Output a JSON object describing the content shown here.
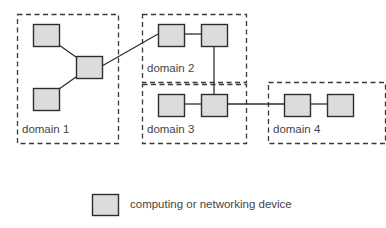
{
  "diagram": {
    "domains": [
      {
        "id": "d1",
        "label": "domain 1",
        "x": 17,
        "y": 14,
        "w": 101,
        "h": 129,
        "label_x": 22,
        "label_y": 124
      },
      {
        "id": "d2",
        "label": "domain 2",
        "x": 142,
        "y": 14,
        "w": 104,
        "h": 68,
        "label_x": 147,
        "label_y": 63
      },
      {
        "id": "d3",
        "label": "domain 3",
        "x": 142,
        "y": 84,
        "w": 104,
        "h": 59,
        "label_x": 147,
        "label_y": 124
      },
      {
        "id": "d4",
        "label": "domain 4",
        "x": 268,
        "y": 82,
        "w": 117,
        "h": 61,
        "label_x": 273,
        "label_y": 124
      }
    ],
    "nodes": [
      {
        "id": "n1",
        "domain": "d1",
        "x": 33,
        "y": 24,
        "w": 26,
        "h": 22
      },
      {
        "id": "n2",
        "domain": "d1",
        "x": 76,
        "y": 56,
        "w": 26,
        "h": 22
      },
      {
        "id": "n3",
        "domain": "d1",
        "x": 33,
        "y": 88,
        "w": 26,
        "h": 22
      },
      {
        "id": "n4",
        "domain": "d2",
        "x": 158,
        "y": 24,
        "w": 26,
        "h": 22
      },
      {
        "id": "n5",
        "domain": "d2",
        "x": 201,
        "y": 24,
        "w": 26,
        "h": 22
      },
      {
        "id": "n6",
        "domain": "d3",
        "x": 158,
        "y": 94,
        "w": 26,
        "h": 22
      },
      {
        "id": "n7",
        "domain": "d3",
        "x": 201,
        "y": 94,
        "w": 26,
        "h": 22
      },
      {
        "id": "n8",
        "domain": "d4",
        "x": 284,
        "y": 94,
        "w": 26,
        "h": 22
      },
      {
        "id": "n9",
        "domain": "d4",
        "x": 327,
        "y": 94,
        "w": 26,
        "h": 22
      }
    ],
    "links": [
      {
        "from": "n1",
        "to": "n2",
        "x1": 59,
        "y1": 45,
        "x2": 76,
        "y2": 57
      },
      {
        "from": "n3",
        "to": "n2",
        "x1": 59,
        "y1": 89,
        "x2": 76,
        "y2": 77
      },
      {
        "from": "n2",
        "to": "n4",
        "x1": 102,
        "y1": 66,
        "x2": 158,
        "y2": 34
      },
      {
        "from": "n4",
        "to": "n5",
        "x1": 184,
        "y1": 34,
        "x2": 201,
        "y2": 34
      },
      {
        "from": "n5",
        "to": "n7",
        "x1": 214,
        "y1": 46,
        "x2": 214,
        "y2": 94
      },
      {
        "from": "n6",
        "to": "n7",
        "x1": 184,
        "y1": 104,
        "x2": 201,
        "y2": 104
      },
      {
        "from": "n7",
        "to": "n8",
        "x1": 227,
        "y1": 104,
        "x2": 284,
        "y2": 104
      },
      {
        "from": "n8",
        "to": "n9",
        "x1": 310,
        "y1": 104,
        "x2": 327,
        "y2": 104
      }
    ],
    "legend": {
      "symbol": {
        "x": 92,
        "y": 194,
        "w": 26,
        "h": 21
      },
      "label": "computing or networking device",
      "label_x": 130,
      "label_y": 199
    },
    "colors": {
      "node_fill": "#dcdcdc",
      "stroke": "#2e2e2e",
      "label_text": "#444444"
    }
  }
}
